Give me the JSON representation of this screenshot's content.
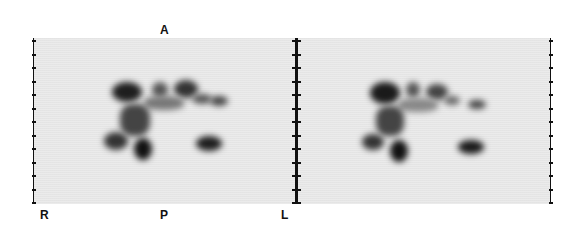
{
  "figure": {
    "type": "nuclear medicine scan (two views)",
    "orientation_labels": {
      "anterior": "A",
      "posterior": "P",
      "right": "R",
      "left": "L"
    },
    "panels": [
      {
        "name": "left-view"
      },
      {
        "name": "right-view"
      }
    ],
    "colors": {
      "background": "#ffffff",
      "panel": "#ebebeb",
      "uptake": "#222222",
      "axis": "#111111"
    },
    "tick_count": 13
  }
}
